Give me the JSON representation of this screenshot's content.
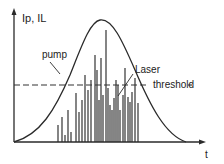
{
  "diagram": {
    "y_axis_label": "Ip, IL",
    "x_axis_label": "t",
    "labels": {
      "pump": "pump",
      "laser": "Laser",
      "threshold": "threshold"
    },
    "colors": {
      "line": "#2a2a2a",
      "background": "#ffffff"
    },
    "spikes": [
      [
        58,
        125
      ],
      [
        62,
        117
      ],
      [
        65,
        135
      ],
      [
        68,
        110
      ],
      [
        71,
        132
      ],
      [
        76,
        93
      ],
      [
        79,
        112
      ],
      [
        82,
        100
      ],
      [
        85,
        75
      ],
      [
        88,
        90
      ],
      [
        91,
        80
      ],
      [
        95,
        55
      ],
      [
        97,
        70
      ],
      [
        99,
        100
      ],
      [
        101,
        58
      ],
      [
        103,
        95
      ],
      [
        106,
        30
      ],
      [
        108,
        88
      ],
      [
        110,
        105
      ],
      [
        112,
        110
      ],
      [
        114,
        98
      ],
      [
        116,
        80
      ],
      [
        118,
        85
      ],
      [
        120,
        110
      ],
      [
        123,
        95
      ],
      [
        125,
        68
      ],
      [
        128,
        97
      ],
      [
        130,
        102
      ],
      [
        132,
        92
      ],
      [
        135,
        78
      ],
      [
        138,
        103
      ]
    ]
  }
}
